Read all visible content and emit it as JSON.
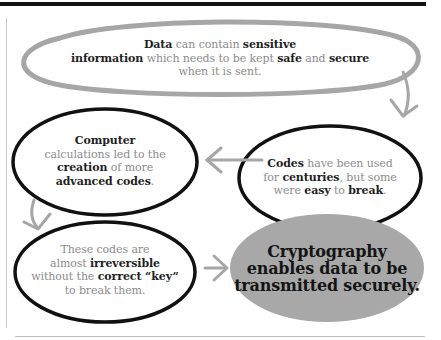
{
  "diagram": {
    "type": "flow",
    "colors": {
      "gray_outline": "#a6a6a6",
      "black_outline": "#111111",
      "final_fill": "#a8a8a8",
      "arrow": "#a6a6a6"
    },
    "nodes": [
      {
        "id": "data",
        "style": "gray-outline",
        "segments": [
          {
            "text": "Data",
            "bold": true
          },
          {
            "text": " can contain ",
            "bold": false
          },
          {
            "text": "sensitive",
            "bold": true
          },
          {
            "text": "\n",
            "bold": false
          },
          {
            "text": "information",
            "bold": true
          },
          {
            "text": " which needs to be kept ",
            "bold": false
          },
          {
            "text": "safe",
            "bold": true
          },
          {
            "text": " and ",
            "bold": false
          },
          {
            "text": "secure",
            "bold": true
          },
          {
            "text": "\n",
            "bold": false
          },
          {
            "text": "when it is sent.",
            "bold": false
          }
        ]
      },
      {
        "id": "codes",
        "style": "black-outline",
        "segments": [
          {
            "text": "Codes",
            "bold": true
          },
          {
            "text": " have been used\nfor ",
            "bold": false
          },
          {
            "text": "centuries",
            "bold": true
          },
          {
            "text": ", but some\nwere ",
            "bold": false
          },
          {
            "text": "easy",
            "bold": true
          },
          {
            "text": " to ",
            "bold": false
          },
          {
            "text": "break",
            "bold": true
          },
          {
            "text": ".",
            "bold": false
          }
        ]
      },
      {
        "id": "computer",
        "style": "black-outline",
        "segments": [
          {
            "text": "Computer",
            "bold": true
          },
          {
            "text": "\ncalculations led to the\n",
            "bold": false
          },
          {
            "text": "creation",
            "bold": true
          },
          {
            "text": " of more\n",
            "bold": false
          },
          {
            "text": "advanced codes",
            "bold": true
          },
          {
            "text": ".",
            "bold": false
          }
        ]
      },
      {
        "id": "irreversible",
        "style": "black-outline",
        "segments": [
          {
            "text": "These codes are\nalmost ",
            "bold": false
          },
          {
            "text": "irreversible",
            "bold": true
          },
          {
            "text": "\nwithout the ",
            "bold": false
          },
          {
            "text": "correct “key”",
            "bold": true
          },
          {
            "text": "\nto break them.",
            "bold": false
          }
        ]
      },
      {
        "id": "cryptography",
        "style": "gray-fill",
        "lines": [
          "Cryptography",
          "enables data to be",
          "transmitted securely."
        ]
      }
    ],
    "edges": [
      {
        "from": "data",
        "to": "codes",
        "direction": "down"
      },
      {
        "from": "codes",
        "to": "computer",
        "direction": "left"
      },
      {
        "from": "computer",
        "to": "irreversible",
        "direction": "down"
      },
      {
        "from": "irreversible",
        "to": "cryptography",
        "direction": "right"
      }
    ]
  }
}
